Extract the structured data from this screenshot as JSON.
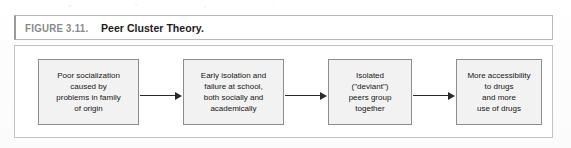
{
  "figure": {
    "label": "FIGURE 3.11.",
    "title": "Peer Cluster Theory."
  },
  "colors": {
    "node_fill": "#f2f2f2",
    "node_border": "#8d8d8d",
    "frame_border": "#c2c2c2",
    "arrow": "#2a2a2a",
    "label_gray": "#8a8a8a",
    "text": "#161616"
  },
  "chart_data": {
    "type": "diagram",
    "subtype": "linear-flowchart",
    "title": "Peer Cluster Theory.",
    "direction": "left-to-right",
    "nodes": [
      {
        "id": "node-1",
        "lines": [
          "Poor socialization",
          "caused by",
          "problems in family",
          "of origin"
        ],
        "text": "Poor socialization caused by problems in family of origin"
      },
      {
        "id": "node-2",
        "lines": [
          "Early isolation and",
          "failure at school,",
          "both socially and",
          "academically"
        ],
        "text": "Early isolation and failure at school, both socially and academically"
      },
      {
        "id": "node-3",
        "lines": [
          "Isolated",
          "(\"deviant\")",
          "peers group",
          "together"
        ],
        "text": "Isolated (\"deviant\") peers group together"
      },
      {
        "id": "node-4",
        "lines": [
          "More accessibility",
          "to drugs",
          "and more",
          "use of drugs"
        ],
        "text": "More accessibility to drugs and more use of drugs"
      }
    ],
    "edges": [
      {
        "id": "arrow-1",
        "from": "node-1",
        "to": "node-2",
        "style": "solid-arrow"
      },
      {
        "id": "arrow-2",
        "from": "node-2",
        "to": "node-3",
        "style": "solid-arrow"
      },
      {
        "id": "arrow-3",
        "from": "node-3",
        "to": "node-4",
        "style": "solid-arrow"
      }
    ]
  }
}
